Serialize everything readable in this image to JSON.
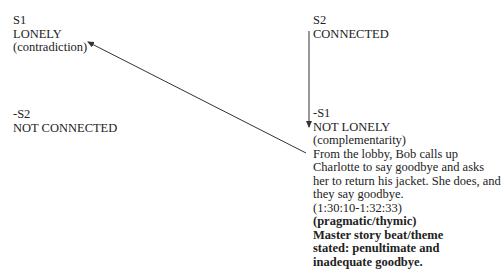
{
  "semiotic_square": {
    "top_left": {
      "code": "S1",
      "term": "LONELY",
      "relation": "(contradiction)"
    },
    "top_right": {
      "code": "S2",
      "term": "CONNECTED"
    },
    "bottom_left": {
      "code": "-S2",
      "term": "NOT CONNECTED"
    },
    "bottom_right": {
      "code": "-S1",
      "term": "NOT LONELY",
      "relation": "(complementarity)",
      "description": "From the lobby, Bob calls up Charlotte to say goodbye and asks her to return his jacket. She does, and they say goodbye.",
      "timecode": "(1:30:10-1:32:33)",
      "category": "(pragmatic/thymic)",
      "beat_label": "Master story beat/theme stated: penultimate and inadequate goodbye."
    }
  },
  "arrows": [
    {
      "from": "-S1",
      "to": "S1",
      "type": "contradiction"
    },
    {
      "from": "S2",
      "to": "-S1",
      "type": "complementarity"
    }
  ],
  "colors": {
    "text": "#222222",
    "line": "#333333",
    "background": "#ffffff"
  }
}
